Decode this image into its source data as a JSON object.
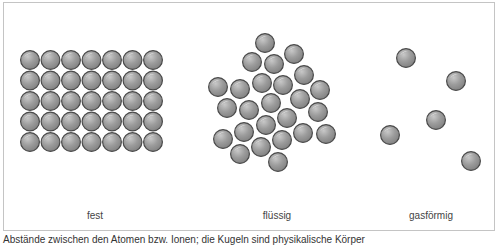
{
  "figure": {
    "panels": [
      {
        "id": "solid",
        "label": "fest",
        "label_x": 95
      },
      {
        "id": "liquid",
        "label": "flüssig",
        "label_x": 277
      },
      {
        "id": "gas",
        "label": "gasförmig",
        "label_x": 431
      }
    ],
    "caption": "Abstände zwischen den Atomen bzw. Ionen; die Kugeln sind physikalische Körper",
    "sphere": {
      "radius": 10,
      "fill": "#9a9a9a",
      "stroke": "#4a4a4a",
      "highlight": "#ffffff"
    },
    "solid_grid": {
      "cols": 7,
      "rows": 5,
      "origin_x": 30,
      "origin_y": 60,
      "spacing": 20.5
    },
    "liquid_spheres": [
      [
        265,
        43
      ],
      [
        252,
        62
      ],
      [
        274,
        64
      ],
      [
        294,
        54
      ],
      [
        304,
        75
      ],
      [
        262,
        83
      ],
      [
        283,
        85
      ],
      [
        218,
        87
      ],
      [
        240,
        89
      ],
      [
        320,
        90
      ],
      [
        227,
        108
      ],
      [
        249,
        110
      ],
      [
        271,
        103
      ],
      [
        300,
        99
      ],
      [
        318,
        112
      ],
      [
        287,
        118
      ],
      [
        266,
        125
      ],
      [
        244,
        132
      ],
      [
        223,
        139
      ],
      [
        303,
        133
      ],
      [
        326,
        134
      ],
      [
        282,
        140
      ],
      [
        261,
        147
      ],
      [
        240,
        154
      ],
      [
        278,
        162
      ]
    ],
    "gas_spheres": [
      [
        406,
        58
      ],
      [
        456,
        81
      ],
      [
        436,
        120
      ],
      [
        390,
        135
      ],
      [
        471,
        161
      ]
    ]
  }
}
